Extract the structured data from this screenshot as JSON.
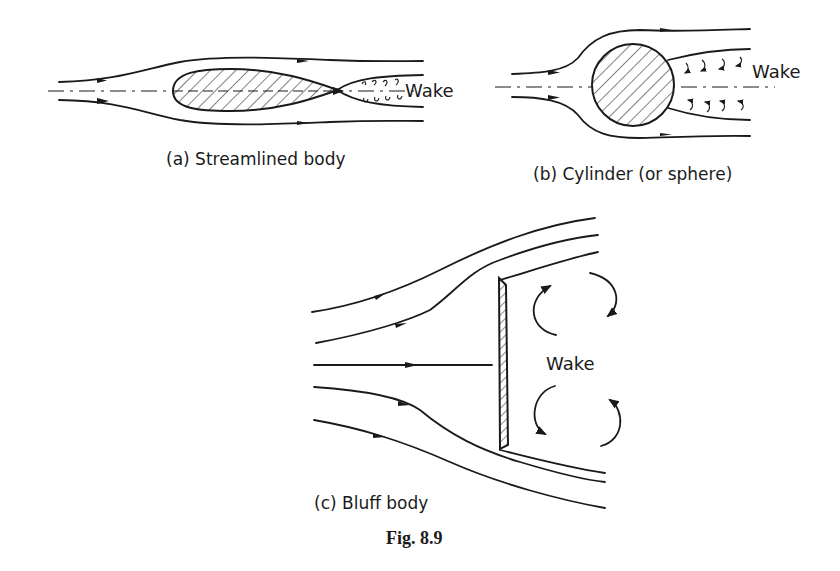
{
  "figure": {
    "caption": "Fig. 8.9",
    "panels": [
      {
        "id": "a",
        "label": "(a) Streamlined body",
        "wake_label": "Wake"
      },
      {
        "id": "b",
        "label": "(b) Cylinder (or sphere)",
        "wake_label": "Wake"
      },
      {
        "id": "c",
        "label": "(c) Bluff body",
        "wake_label": "Wake"
      }
    ]
  },
  "colors": {
    "ink": "#1a1a1a",
    "background": "#ffffff"
  }
}
